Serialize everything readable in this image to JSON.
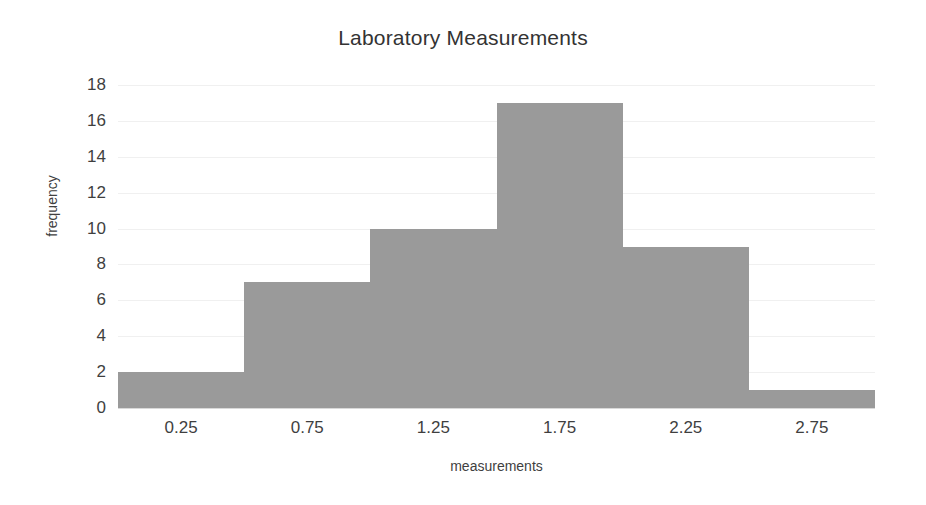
{
  "chart_data": {
    "type": "bar",
    "title": "Laboratory Measurements",
    "xlabel": "measurements",
    "ylabel": "frequency",
    "categories": [
      "0.00-0.50",
      "0.50-1.00",
      "1.00-1.50",
      "1.50-2.00",
      "2.00-2.50",
      "2.50-3.00"
    ],
    "bin_edges": [
      0.0,
      0.5,
      1.0,
      1.5,
      2.0,
      2.5,
      3.0
    ],
    "bin_width": 0.5,
    "values": [
      2,
      7,
      10,
      17,
      9,
      1
    ],
    "xtick_labels": [
      "0.25",
      "0.75",
      "1.25",
      "1.75",
      "2.25",
      "2.75"
    ],
    "xtick_values": [
      0.25,
      0.75,
      1.25,
      1.75,
      2.25,
      2.75
    ],
    "ytick_labels": [
      "0",
      "2",
      "4",
      "6",
      "8",
      "10",
      "12",
      "14",
      "16",
      "18"
    ],
    "ytick_values": [
      0,
      2,
      4,
      6,
      8,
      10,
      12,
      14,
      16,
      18
    ],
    "xlim": [
      0.0,
      3.0
    ],
    "ylim": [
      0,
      18
    ],
    "grid": true,
    "legend": false,
    "bar_color": "#9a9a9a",
    "grid_color": "#f0f0f0",
    "text_color": "#3f3f3f",
    "background": "#ffffff"
  }
}
